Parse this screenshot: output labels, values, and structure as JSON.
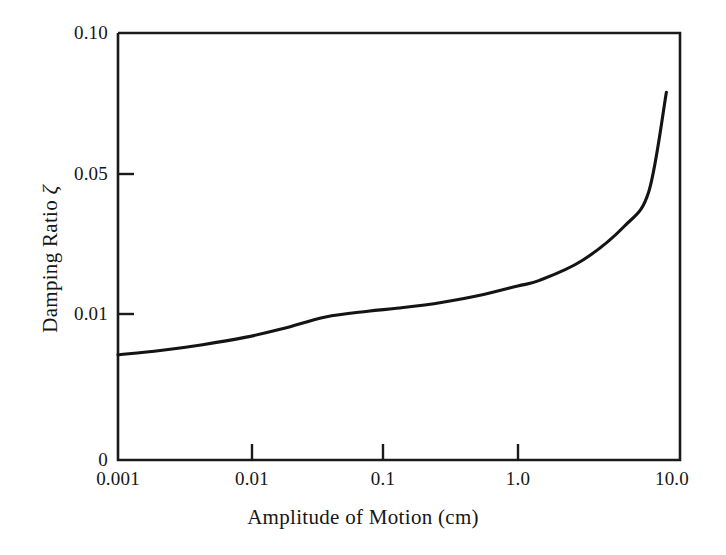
{
  "figure": {
    "background_color": "#ffffff",
    "ink_color": "#1a1a1a",
    "curve_color": "#141414"
  },
  "chart_data": {
    "type": "line",
    "title": "",
    "subtitle": "",
    "xlabel": "Amplitude of Motion (cm)",
    "ylabel": "Damping Ratio ζ",
    "xscale": "log",
    "yscale": "nonlinear-compressed",
    "xlim": [
      0.001,
      10.0
    ],
    "ylim": [
      0,
      0.1
    ],
    "grid": false,
    "legend": null,
    "xticks": [
      0.001,
      0.01,
      0.1,
      1.0,
      10.0
    ],
    "xtick_labels": [
      "0.001",
      "0.01",
      "0.1",
      "1.0",
      "10.0"
    ],
    "yticks": [
      0,
      0.01,
      0.05,
      0.1
    ],
    "ytick_labels": [
      "0",
      "0.01",
      "0.05",
      "0.10"
    ],
    "series": [
      {
        "name": "Damping Ratio vs Amplitude",
        "x": [
          0.001,
          0.002,
          0.004,
          0.008,
          0.015,
          0.03,
          0.06,
          0.1,
          0.2,
          0.4,
          0.7,
          1.0,
          2.0,
          4.0,
          6.0,
          8.0
        ],
        "y": [
          0.0072,
          0.0075,
          0.0079,
          0.0084,
          0.009,
          0.0098,
          0.0108,
          0.0117,
          0.0133,
          0.0156,
          0.018,
          0.0196,
          0.0252,
          0.035,
          0.045,
          0.079
        ]
      }
    ],
    "annotations": []
  },
  "axes": {
    "x_title": "Amplitude of Motion (cm)",
    "y_title_text": "Damping Ratio",
    "y_title_symbol": "ζ",
    "x_tick_labels": [
      "0.001",
      "0.01",
      "0.1",
      "1.0",
      "10.0"
    ],
    "y_tick_labels": [
      "0.10",
      "0.05",
      "0.01",
      "0"
    ]
  }
}
